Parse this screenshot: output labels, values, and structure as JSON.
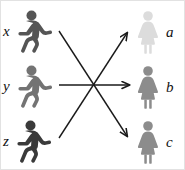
{
  "diagram": {
    "type": "bipartite-matching",
    "title": "",
    "background_color": "#ffffff",
    "border_color": "#e2e2e2",
    "arrow_color": "#1a1a1a",
    "label_color": "#111111",
    "left_group": {
      "name": "men",
      "icon": "male-figure-icon",
      "nodes": [
        {
          "id": "x",
          "label": "x",
          "color": "#555555",
          "x": 22,
          "y": 8
        },
        {
          "id": "y",
          "label": "y",
          "color": "#737373",
          "x": 22,
          "y": 63
        },
        {
          "id": "z",
          "label": "z",
          "color": "#3a3a3a",
          "x": 22,
          "y": 118
        }
      ]
    },
    "right_group": {
      "name": "women",
      "icon": "female-figure-icon",
      "nodes": [
        {
          "id": "a",
          "label": "a",
          "color": "#dcdcdc",
          "x": 134,
          "y": 9
        },
        {
          "id": "b",
          "label": "b",
          "color": "#8c8c8c",
          "x": 134,
          "y": 64
        },
        {
          "id": "c",
          "label": "c",
          "color": "#8c8c8c",
          "x": 134,
          "y": 119
        }
      ]
    },
    "edges": [
      {
        "id": "x-to-c",
        "from": "x",
        "to": "c",
        "x1": 58,
        "y1": 30,
        "x2": 126,
        "y2": 135
      },
      {
        "id": "y-to-b",
        "from": "y",
        "to": "b",
        "x1": 58,
        "y1": 84,
        "x2": 128,
        "y2": 84
      },
      {
        "id": "z-to-a",
        "from": "z",
        "to": "a",
        "x1": 58,
        "y1": 137,
        "x2": 126,
        "y2": 32
      }
    ]
  }
}
